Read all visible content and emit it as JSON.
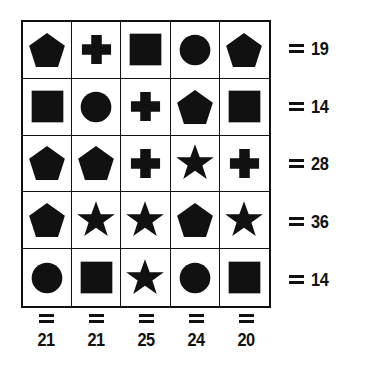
{
  "puzzle": {
    "type": "shape-sum-grid",
    "ink_color": "#111111",
    "background_color": "#ffffff",
    "rows": 5,
    "columns": 5,
    "shape_legend": [
      "pentagon",
      "cross",
      "square",
      "circle",
      "star"
    ],
    "grid": [
      [
        "pentagon",
        "cross",
        "square",
        "circle",
        "pentagon"
      ],
      [
        "square",
        "circle",
        "cross",
        "pentagon",
        "square"
      ],
      [
        "pentagon",
        "pentagon",
        "cross",
        "star",
        "cross"
      ],
      [
        "pentagon",
        "star",
        "star",
        "pentagon",
        "star"
      ],
      [
        "circle",
        "square",
        "star",
        "circle",
        "square"
      ]
    ],
    "row_sums": [
      "19",
      "14",
      "28",
      "36",
      "14"
    ],
    "column_sums": [
      "21",
      "21",
      "25",
      "24",
      "20"
    ],
    "equals_symbol": "="
  }
}
